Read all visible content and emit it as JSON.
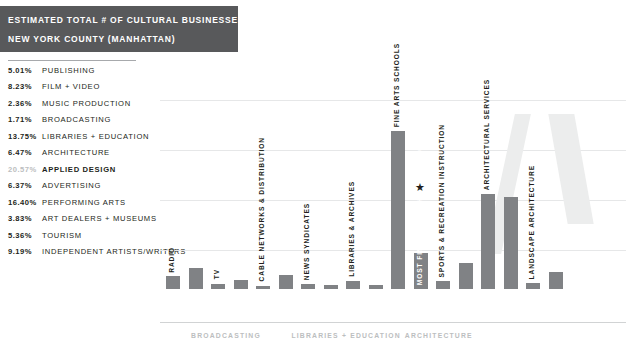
{
  "header": {
    "line1_label": "ESTIMATED TOTAL # OF CULTURAL BUSINESSES",
    "line1_value": "15,630",
    "line2": "NEW YORK COUNTY (MANHATTAN)",
    "background": "#58595b"
  },
  "legend": {
    "items": [
      {
        "pct": "5.01%",
        "label": "PUBLISHING"
      },
      {
        "pct": "8.23%",
        "label": "FILM + VIDEO"
      },
      {
        "pct": "2.36%",
        "label": "MUSIC PRODUCTION"
      },
      {
        "pct": "1.71%",
        "label": "BROADCASTING"
      },
      {
        "pct": "13.75%",
        "label": "LIBRARIES + EDUCATION"
      },
      {
        "pct": "6.47%",
        "label": "ARCHITECTURE"
      },
      {
        "pct": "20.57%",
        "label": "APPLIED DESIGN",
        "highlight": true
      },
      {
        "pct": "6.37%",
        "label": "ADVERTISING"
      },
      {
        "pct": "16.40%",
        "label": "PERFORMING ARTS"
      },
      {
        "pct": "3.83%",
        "label": "ART DEALERS + MUSEUMS"
      },
      {
        "pct": "5.36%",
        "label": "TOURISM"
      },
      {
        "pct": "9.19%",
        "label": "INDEPENDENT ARTISTS/WRITERS"
      }
    ]
  },
  "chart_data": {
    "type": "bar",
    "xlabel": "",
    "ylabel": "",
    "ylim": [
      0,
      2000
    ],
    "grid": true,
    "legend_position": "left",
    "bar_color": "#808285",
    "annotation": "★ MOST FINE ARTS SCHOOLS IN NYC",
    "groups": [
      {
        "name": "BROADCASTING",
        "start": 0,
        "end": 5
      },
      {
        "name": "LIBRARIES + EDUCATION",
        "start": 6,
        "end": 10
      },
      {
        "name": "ARCHITECTURE",
        "start": 11,
        "end": 13
      }
    ],
    "categories": [
      "RADIO",
      "",
      "TV",
      "",
      "CABLE NETWORKS & DISTRIBUTION",
      "NEWS SYNDICATES",
      "",
      "LIBRARIES & ARCHIVES",
      "",
      "FINE ARTS SCHOOLS",
      "MOST FINE ARTS SCHOOLS IN NYC",
      "SPORTS & RECREATION INSTRUCTION",
      "",
      "ARCHITECTURAL SERVICES",
      "",
      "LANDSCAPE ARCHITECTURE",
      ""
    ],
    "bars": [
      {
        "label": "RADIO",
        "value": 126,
        "label_on_bar": false,
        "star": false
      },
      {
        "label": "",
        "value": 210,
        "label_on_bar": false,
        "star": false
      },
      {
        "label": "TV",
        "value": 55,
        "label_on_bar": false,
        "star": false
      },
      {
        "label": "",
        "value": 88,
        "label_on_bar": false,
        "star": false
      },
      {
        "label": "CABLE NETWORKS & DISTRIBUTION",
        "value": 34,
        "label_on_bar": false,
        "star": false
      },
      {
        "label": "",
        "value": 141,
        "label_on_bar": false,
        "star": false
      },
      {
        "label": "NEWS SYNDICATES",
        "value": 52,
        "label_on_bar": false,
        "star": false
      },
      {
        "label": "",
        "value": 41,
        "label_on_bar": false,
        "star": false
      },
      {
        "label": "LIBRARIES & ARCHIVES",
        "value": 79,
        "label_on_bar": false,
        "star": false
      },
      {
        "label": "",
        "value": 38,
        "label_on_bar": false,
        "star": false
      },
      {
        "label": "FINE ARTS SCHOOLS",
        "value": 1589,
        "label_on_bar": false,
        "star": false
      },
      {
        "label": "MOST FINE ARTS SCHOOLS IN NYC",
        "value": 358,
        "label_on_bar": true,
        "star": true
      },
      {
        "label": "SPORTS & RECREATION INSTRUCTION",
        "value": 81,
        "label_on_bar": false,
        "star": false
      },
      {
        "label": "",
        "value": 258,
        "label_on_bar": false,
        "star": false
      },
      {
        "label": "ARCHITECTURAL SERVICES",
        "value": 954,
        "label_on_bar": false,
        "star": false
      },
      {
        "label": "",
        "value": 925,
        "label_on_bar": false,
        "star": false
      },
      {
        "label": "LANDSCAPE ARCHITECTURE",
        "value": 57,
        "label_on_bar": false,
        "star": false
      },
      {
        "label": "",
        "value": 168,
        "label_on_bar": false,
        "star": false
      }
    ]
  }
}
